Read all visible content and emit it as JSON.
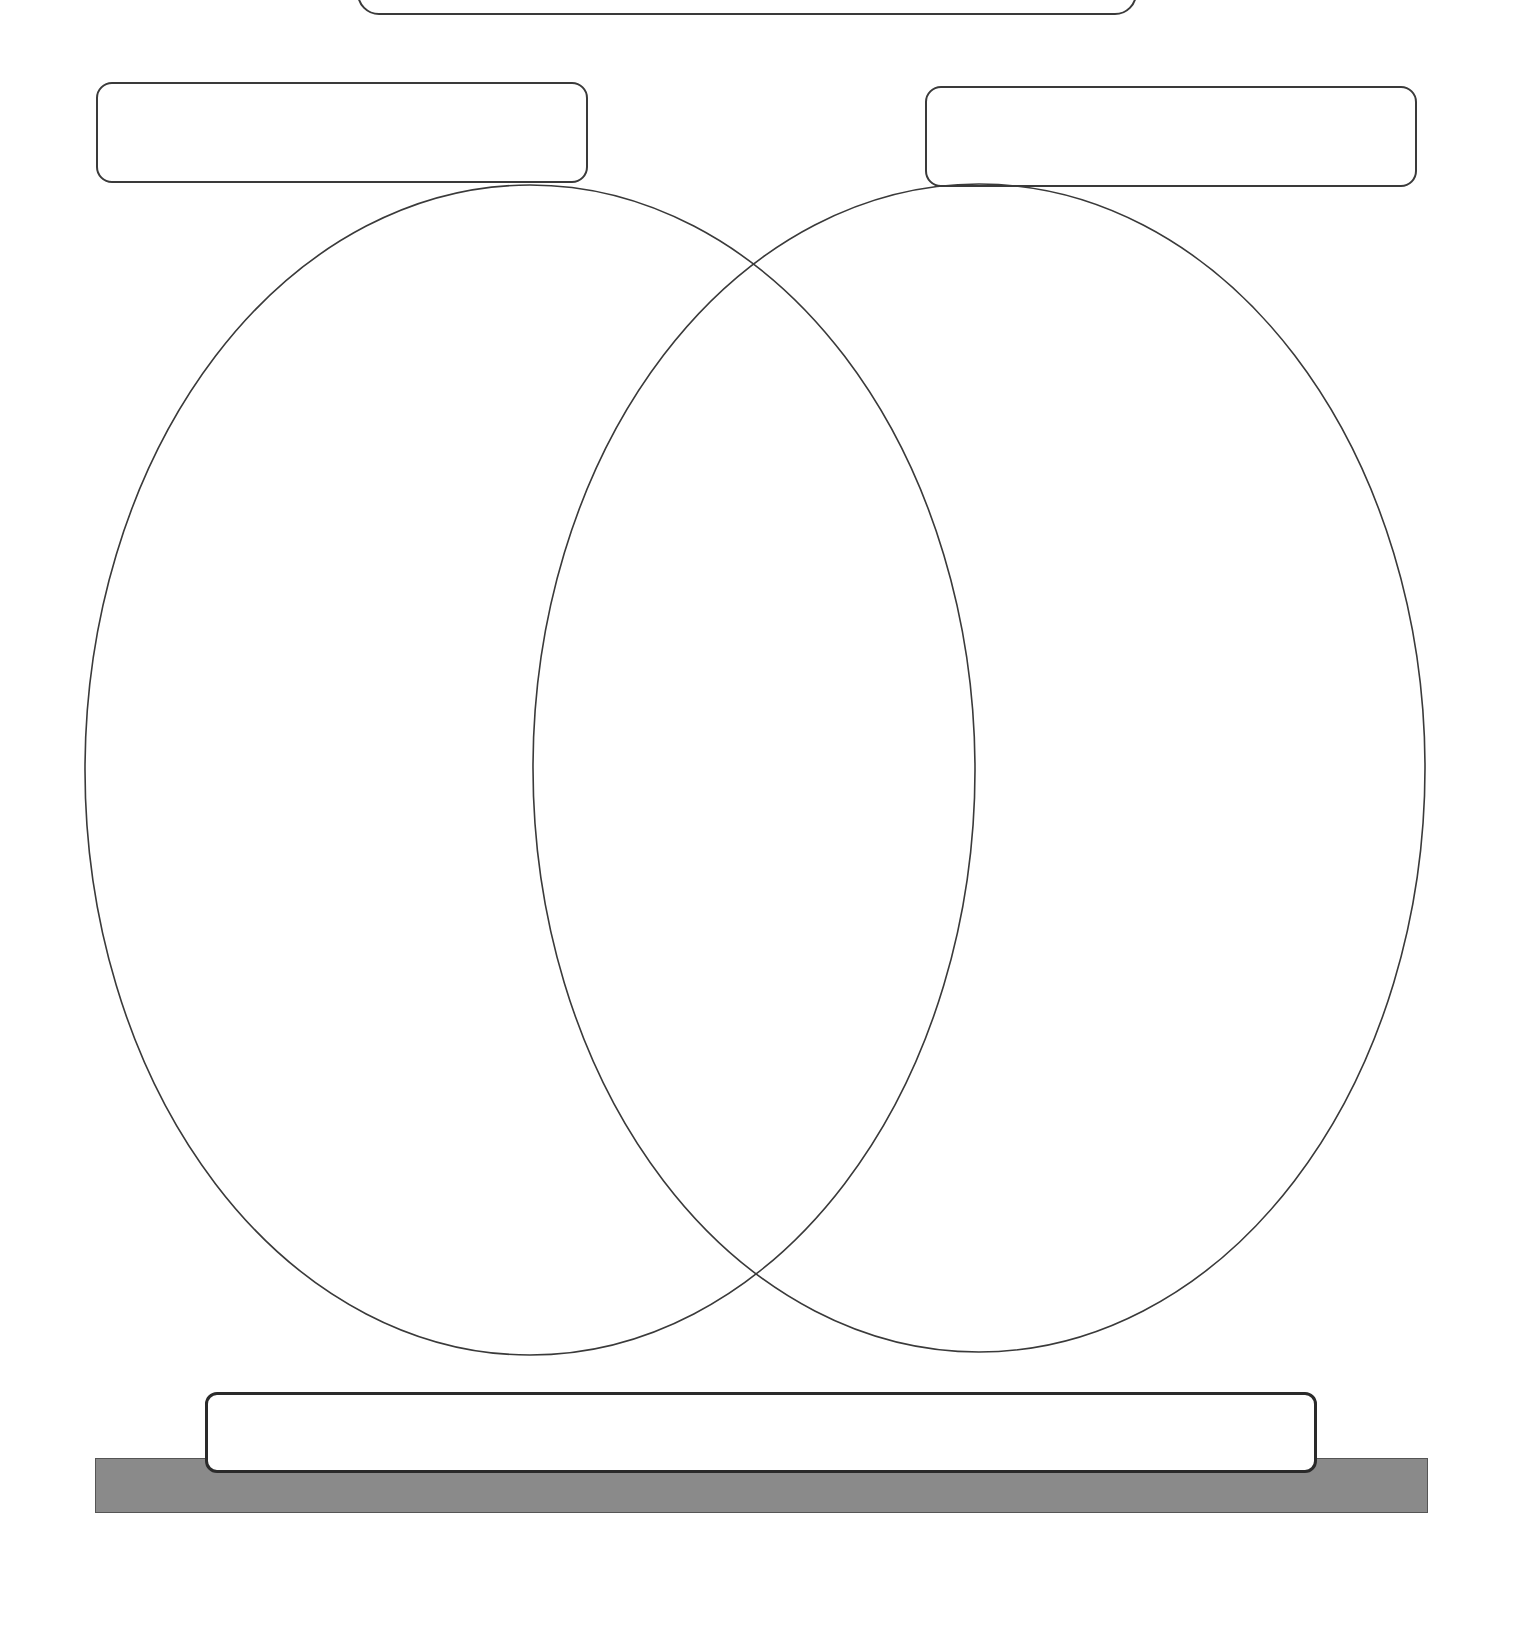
{
  "diagram": {
    "type": "venn",
    "sets": 2,
    "top_title_box": {
      "text": ""
    },
    "left_label_box": {
      "text": ""
    },
    "right_label_box": {
      "text": ""
    },
    "bottom_box": {
      "text": ""
    },
    "regions": {
      "left_only": "",
      "overlap": "",
      "right_only": ""
    },
    "colors": {
      "outline": "#3a3a3a",
      "background": "#ffffff",
      "base_bar": "#8a8a8a"
    }
  }
}
